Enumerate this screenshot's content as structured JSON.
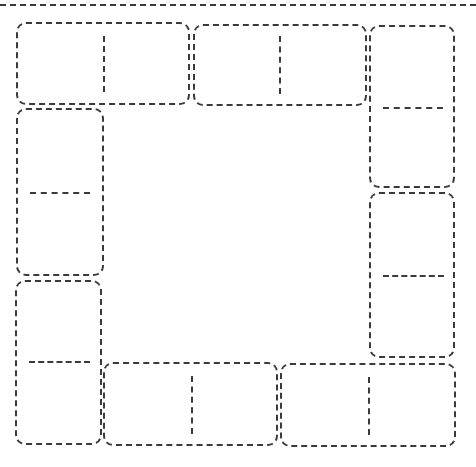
{
  "diagram": {
    "type": "domino-frame-template",
    "stroke_color": "#3a3a3a",
    "background_color": "#ffffff",
    "top_rule": {
      "x1": 0,
      "x2": 476,
      "y": 5
    },
    "tiles": [
      {
        "id": "t1",
        "orientation": "horizontal",
        "x": 16,
        "y": 22,
        "w": 174,
        "h": 83,
        "halves": [
          "",
          ""
        ]
      },
      {
        "id": "t2",
        "orientation": "horizontal",
        "x": 193,
        "y": 24,
        "w": 174,
        "h": 82,
        "halves": [
          "",
          ""
        ]
      },
      {
        "id": "t3",
        "orientation": "vertical",
        "x": 369,
        "y": 25,
        "w": 86,
        "h": 163,
        "halves": [
          "",
          ""
        ]
      },
      {
        "id": "t4",
        "orientation": "vertical",
        "x": 16,
        "y": 108,
        "w": 88,
        "h": 168,
        "halves": [
          "",
          ""
        ]
      },
      {
        "id": "t5",
        "orientation": "vertical",
        "x": 369,
        "y": 192,
        "w": 86,
        "h": 166,
        "halves": [
          "",
          ""
        ]
      },
      {
        "id": "t6",
        "orientation": "vertical",
        "x": 15,
        "y": 280,
        "w": 87,
        "h": 165,
        "halves": [
          "",
          ""
        ]
      },
      {
        "id": "t7",
        "orientation": "horizontal",
        "x": 103,
        "y": 362,
        "w": 175,
        "h": 84,
        "halves": [
          "",
          ""
        ]
      },
      {
        "id": "t8",
        "orientation": "horizontal",
        "x": 280,
        "y": 363,
        "w": 176,
        "h": 84,
        "halves": [
          "",
          ""
        ]
      }
    ],
    "center": {
      "content": ""
    }
  }
}
